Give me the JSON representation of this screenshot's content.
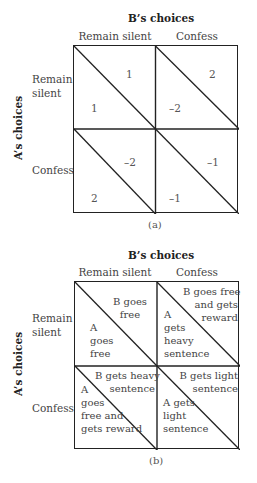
{
  "figure_a": {
    "col_heading": "B’s choices",
    "row_heading": "A’s choices",
    "columns": [
      "Remain silent",
      "Confess"
    ],
    "rows": [
      "Remain silent",
      "Confess"
    ],
    "row_labels_wrapped": [
      [
        "Remain",
        "silent"
      ],
      [
        "Confess"
      ]
    ],
    "cells": [
      [
        {
          "b": "1",
          "a": "1"
        },
        {
          "b": "2",
          "a": "–2"
        }
      ],
      [
        {
          "b": "–2",
          "a": "2"
        },
        {
          "b": "–1",
          "a": "–1"
        }
      ]
    ],
    "caption": "(a)"
  },
  "figure_b": {
    "col_heading": "B’s choices",
    "row_heading": "A’s choices",
    "columns": [
      "Remain silent",
      "Confess"
    ],
    "rows": [
      "Remain silent",
      "Confess"
    ],
    "row_labels_wrapped": [
      [
        "Remain",
        "silent"
      ],
      [
        "Confess"
      ]
    ],
    "cells": [
      [
        {
          "b": [
            "B goes",
            "free"
          ],
          "a": [
            "A",
            "goes",
            "free"
          ]
        },
        {
          "b": [
            "B goes free",
            "and gets",
            "reward"
          ],
          "a": [
            "A",
            "gets",
            "heavy",
            "sentence"
          ]
        }
      ],
      [
        {
          "b": [
            "B gets heavy",
            "sentence"
          ],
          "a": [
            "A",
            "goes",
            "free and",
            "gets reward"
          ]
        },
        {
          "b": [
            "B gets light",
            "sentence"
          ],
          "a": [
            "A gets",
            "light",
            "sentence"
          ]
        }
      ]
    ],
    "caption": "(b)"
  }
}
